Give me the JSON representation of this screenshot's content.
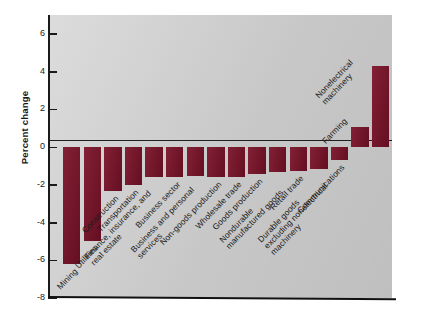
{
  "chart_data": {
    "type": "bar",
    "title": "",
    "xlabel": "",
    "ylabel": "Percent change",
    "ylim": [
      -8,
      7
    ],
    "yticks": [
      6,
      4,
      2,
      0,
      -2,
      -4,
      -6,
      -8
    ],
    "ytick_labels": [
      "6",
      "4",
      "2",
      "0",
      "-2",
      "-4",
      "-6",
      "-8"
    ],
    "grid": false,
    "legend": "none",
    "bar_color": "#7b1229",
    "plot_background": "#d2d2d2",
    "categories": [
      "Mining",
      "Utilities",
      "Construction",
      "Transportation",
      "Finance, insurance, and real estate",
      "Business sector",
      "Business and personal services",
      "Non-goods production",
      "Wholesale trade",
      "Goods production",
      "Nondurable manufactured goods",
      "Retail trade",
      "Durable goods excluding nonelectrical machinery",
      "Communications",
      "Farming",
      "Nonelectrical machinery"
    ],
    "values": [
      -6.2,
      -5.0,
      -2.35,
      -2.0,
      -1.6,
      -1.6,
      -1.55,
      -1.6,
      -1.6,
      -1.45,
      -1.3,
      -1.25,
      -1.15,
      -0.7,
      1.05,
      4.3
    ]
  },
  "axis": {
    "y_title": "Percent change"
  }
}
